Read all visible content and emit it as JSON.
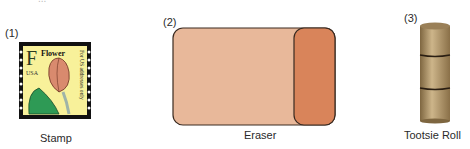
{
  "figure": {
    "top_partial_text": "...",
    "items": [
      {
        "number": "(1)",
        "caption": "Stamp",
        "stamp": {
          "letter": "F",
          "title": "Flower",
          "country": "USA",
          "side_text": "For US addresses only",
          "colors": {
            "background": "#f8f19a",
            "border": "#111111",
            "petal": "#d98a6e",
            "leaf": "#2e9a55",
            "stem": "#9fb4a8"
          }
        }
      },
      {
        "number": "(2)",
        "caption": "Eraser",
        "colors": {
          "body": "#e8b89a",
          "end": "#d9845a",
          "outline": "#3a2a20"
        }
      },
      {
        "number": "(3)",
        "caption": "Tootsie Roll",
        "colors": {
          "body": "#a58a5e",
          "highlight": "#cdb58a",
          "band": "#2a1e12"
        }
      }
    ]
  }
}
